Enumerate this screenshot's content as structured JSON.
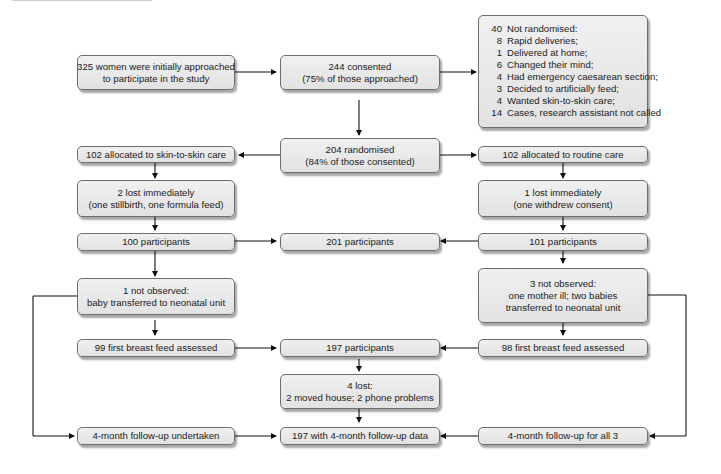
{
  "flowchart": {
    "approached": {
      "lines": [
        "325 women were initially approached",
        "to participate in the study"
      ]
    },
    "consented": {
      "lines": [
        "244 consented",
        "(75% of those approached)"
      ]
    },
    "not_randomised": {
      "title": {
        "n": "40",
        "label": "Not randomised:"
      },
      "items": [
        {
          "n": "8",
          "label": "Rapid deliveries;"
        },
        {
          "n": "1",
          "label": "Delivered at home;"
        },
        {
          "n": "6",
          "label": "Changed their mind;"
        },
        {
          "n": "4",
          "label": "Had emergency caesarean section;"
        },
        {
          "n": "3",
          "label": "Decided to artificially feed;"
        },
        {
          "n": "4",
          "label": "Wanted skin-to-skin care;"
        },
        {
          "n": "14",
          "label": "Cases, research assistant not called"
        }
      ]
    },
    "randomised": {
      "lines": [
        "204 randomised",
        "(84% of those consented)"
      ]
    },
    "left": {
      "allocated": {
        "lines": [
          "102 allocated to skin-to-skin care"
        ]
      },
      "lost": {
        "lines": [
          "2 lost immediately",
          "(one stillbirth, one formula feed)"
        ]
      },
      "participants": {
        "lines": [
          "100 participants"
        ]
      },
      "not_observed": {
        "lines": [
          "1 not observed:",
          "baby transferred to neonatal unit"
        ]
      },
      "assessed": {
        "lines": [
          "99 first breast feed assessed"
        ]
      },
      "followup": {
        "lines": [
          "4-month follow-up undertaken"
        ]
      }
    },
    "right": {
      "allocated": {
        "lines": [
          "102 allocated to routine care"
        ]
      },
      "lost": {
        "lines": [
          "1 lost immediately",
          "(one withdrew consent)"
        ]
      },
      "participants": {
        "lines": [
          "101 participants"
        ]
      },
      "not_observed": {
        "lines": [
          "3 not observed:",
          "one mother ill; two babies",
          "transferred to neonatal unit"
        ]
      },
      "assessed": {
        "lines": [
          "98 first breast feed assessed"
        ]
      },
      "followup": {
        "lines": [
          "4-month follow-up for all 3"
        ]
      }
    },
    "center": {
      "participants_201": {
        "lines": [
          "201 participants"
        ]
      },
      "participants_197": {
        "lines": [
          "197 participants"
        ]
      },
      "lost_4": {
        "lines": [
          "4 lost:",
          "2 moved house; 2 phone problems"
        ]
      },
      "followup_197": {
        "lines": [
          "197 with 4-month follow-up data"
        ]
      }
    }
  },
  "colors": {
    "box_fill": "#e8e8e8",
    "box_border": "#6e6e6e",
    "line": "#111111",
    "text": "#222222"
  }
}
